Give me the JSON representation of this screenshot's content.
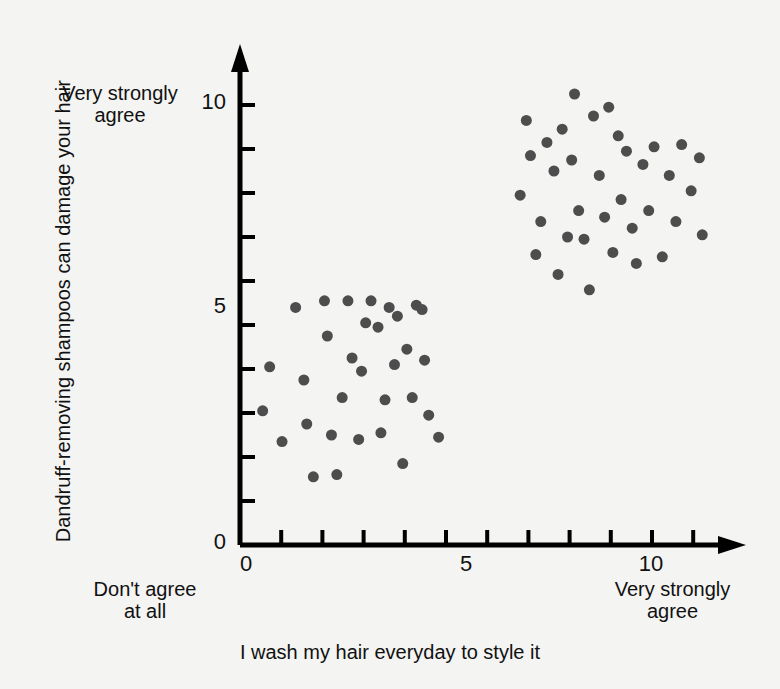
{
  "chart_data": {
    "type": "scatter",
    "title": "",
    "subtitle": "",
    "xlabel": "I wash my hair everyday to style it",
    "ylabel": "Dandruff-removing shampoos can damage your hair",
    "xlim": [
      0,
      11.6
    ],
    "ylim": [
      0,
      10.9
    ],
    "xticks": [
      0,
      1,
      2,
      3,
      4,
      5,
      6,
      7,
      8,
      9,
      10,
      11
    ],
    "yticks": [
      0,
      1,
      2,
      3,
      4,
      5,
      6,
      7,
      8,
      9,
      10
    ],
    "xtick_labels_shown": [
      "0",
      "5",
      "10"
    ],
    "ytick_labels_shown": [
      "0",
      "5",
      "10"
    ],
    "grid": false,
    "legend": null,
    "marker_color": "#4d4d4d",
    "marker_size_px": 11,
    "axis_color": "#000000",
    "background_color": "#f4f4f2",
    "annotations": {
      "y_axis_top": "Very strongly\nagree",
      "x_axis_left": "Don't agree\nat all",
      "x_axis_right": "Very strongly\nagree"
    },
    "series": [
      {
        "name": "Low-wash cluster",
        "points": [
          [
            0.55,
            3.05
          ],
          [
            0.72,
            4.05
          ],
          [
            1.02,
            2.35
          ],
          [
            1.35,
            5.4
          ],
          [
            1.55,
            3.75
          ],
          [
            1.62,
            2.75
          ],
          [
            1.78,
            1.55
          ],
          [
            2.05,
            5.55
          ],
          [
            2.12,
            4.75
          ],
          [
            2.22,
            2.5
          ],
          [
            2.35,
            1.6
          ],
          [
            2.48,
            3.35
          ],
          [
            2.62,
            5.55
          ],
          [
            2.72,
            4.25
          ],
          [
            2.88,
            2.4
          ],
          [
            2.95,
            3.95
          ],
          [
            3.05,
            5.05
          ],
          [
            3.18,
            5.55
          ],
          [
            3.35,
            4.95
          ],
          [
            3.42,
            2.55
          ],
          [
            3.52,
            3.3
          ],
          [
            3.62,
            5.4
          ],
          [
            3.75,
            4.1
          ],
          [
            3.82,
            5.2
          ],
          [
            3.95,
            1.85
          ],
          [
            4.05,
            4.45
          ],
          [
            4.18,
            3.35
          ],
          [
            4.28,
            5.45
          ],
          [
            4.42,
            5.35
          ],
          [
            4.48,
            4.2
          ],
          [
            4.58,
            2.95
          ],
          [
            4.82,
            2.45
          ]
        ]
      },
      {
        "name": "High-wash cluster",
        "points": [
          [
            6.8,
            7.95
          ],
          [
            6.95,
            9.65
          ],
          [
            7.05,
            8.85
          ],
          [
            7.18,
            6.6
          ],
          [
            7.3,
            7.35
          ],
          [
            7.45,
            9.15
          ],
          [
            7.62,
            8.5
          ],
          [
            7.72,
            6.15
          ],
          [
            7.82,
            9.45
          ],
          [
            7.95,
            7.0
          ],
          [
            8.05,
            8.75
          ],
          [
            8.12,
            10.25
          ],
          [
            8.22,
            7.6
          ],
          [
            8.35,
            6.95
          ],
          [
            8.48,
            5.8
          ],
          [
            8.58,
            9.75
          ],
          [
            8.72,
            8.4
          ],
          [
            8.85,
            7.45
          ],
          [
            8.95,
            9.95
          ],
          [
            9.05,
            6.65
          ],
          [
            9.18,
            9.3
          ],
          [
            9.25,
            7.85
          ],
          [
            9.38,
            8.95
          ],
          [
            9.52,
            7.2
          ],
          [
            9.62,
            6.4
          ],
          [
            9.78,
            8.65
          ],
          [
            9.92,
            7.6
          ],
          [
            10.05,
            9.05
          ],
          [
            10.25,
            6.55
          ],
          [
            10.42,
            8.4
          ],
          [
            10.58,
            7.35
          ],
          [
            10.72,
            9.1
          ],
          [
            10.95,
            8.05
          ],
          [
            11.15,
            8.8
          ],
          [
            11.22,
            7.05
          ]
        ]
      }
    ]
  },
  "axis_labels": {
    "y_10": "10",
    "y_5": "5",
    "y_0": "0",
    "x_0": "0",
    "x_5": "5",
    "x_10": "10"
  },
  "annotations": {
    "y_top": "Very strongly\nagree",
    "x_left": "Don't agree\nat all",
    "x_right": "Very strongly\nagree"
  },
  "titles": {
    "x_axis": "I wash my hair everyday to style it",
    "y_axis": "Dandruff-removing shampoos can damage your hair"
  }
}
